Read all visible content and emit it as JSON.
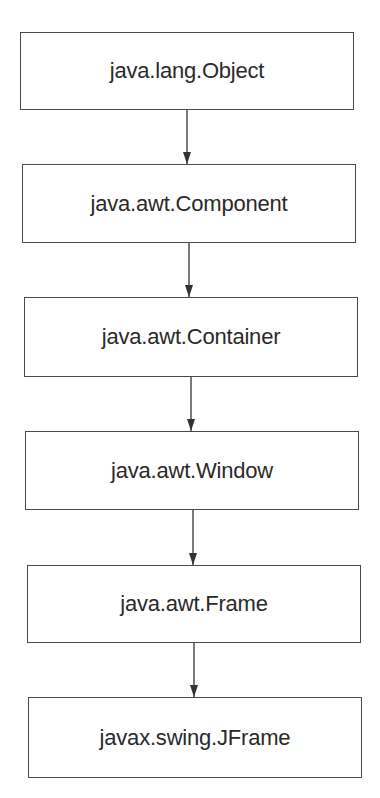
{
  "diagram": {
    "type": "class-hierarchy",
    "nodes": [
      {
        "id": "object",
        "label": "java.lang.Object"
      },
      {
        "id": "component",
        "label": "java.awt.Component"
      },
      {
        "id": "container",
        "label": "java.awt.Container"
      },
      {
        "id": "window",
        "label": "java.awt.Window"
      },
      {
        "id": "frame",
        "label": "java.awt.Frame"
      },
      {
        "id": "jframe",
        "label": "javax.swing.JFrame"
      }
    ],
    "edges": [
      {
        "from": "object",
        "to": "component"
      },
      {
        "from": "component",
        "to": "container"
      },
      {
        "from": "container",
        "to": "window"
      },
      {
        "from": "window",
        "to": "frame"
      },
      {
        "from": "frame",
        "to": "jframe"
      }
    ],
    "colors": {
      "stroke": "#4a4a4a",
      "text": "#2a2a2a",
      "background": "#ffffff"
    }
  }
}
